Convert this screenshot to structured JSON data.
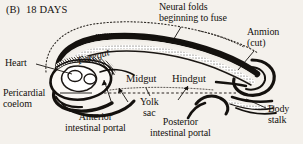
{
  "figure": {
    "panel_letter": "(B)",
    "title": "18 DAYS",
    "background_color": "#f4f1ec",
    "ink_color": "#15120f"
  },
  "labels": {
    "neural_folds": "Neural folds\nbeginning to fuse",
    "amnion": "Anmion\n(cut)",
    "heart": "Heart",
    "pericardial_coelom": "Pericardial\ncoelom",
    "foregut": "Foregut",
    "midgut": "Midgut",
    "hindgut": "Hindgut",
    "yolk_sac": "Yolk\nsac",
    "anterior_intestinal_portal": "Anterior\nintestinal portal",
    "posterior_intestinal_portal": "Posterior\nintestinal portal",
    "body_stalk": "Body\nstalk"
  },
  "structures": [
    {
      "name": "amnion-outline",
      "style": "dotted"
    },
    {
      "name": "neural-tube",
      "style": "solid-dark"
    },
    {
      "name": "embryo-body",
      "style": "solid-dark-shaded"
    },
    {
      "name": "yolk-sac-boundary",
      "style": "dashed"
    },
    {
      "name": "heart-region",
      "style": "outline"
    },
    {
      "name": "body-stalk-coil",
      "style": "solid-dark"
    }
  ]
}
